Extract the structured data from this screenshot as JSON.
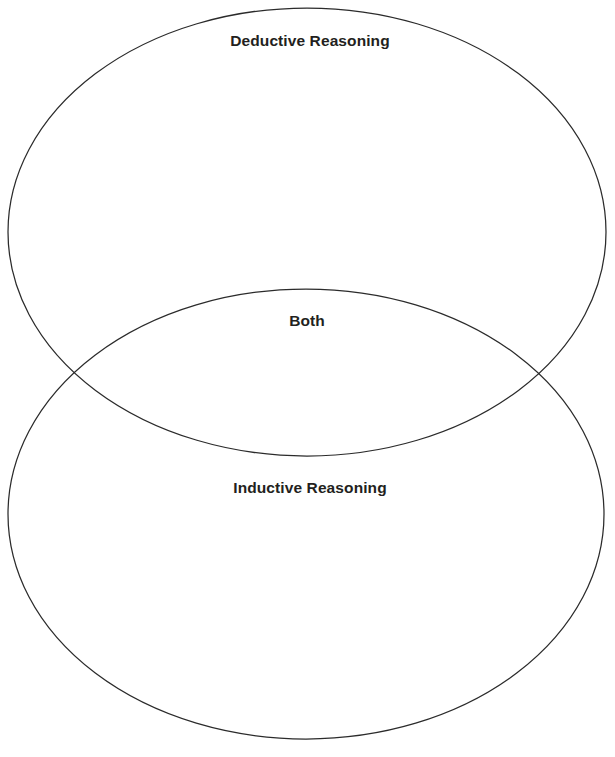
{
  "diagram": {
    "type": "venn",
    "title": "",
    "background_color": "#ffffff",
    "stroke_color": "#2b2b2b",
    "text_color": "#231f20",
    "sets": [
      {
        "id": "deductive",
        "label": "Deductive Reasoning",
        "position": "top",
        "shape": "ellipse",
        "cx": 307,
        "cy": 232,
        "rx": 299,
        "ry": 224,
        "items": []
      },
      {
        "id": "inductive",
        "label": "Inductive Reasoning",
        "position": "bottom",
        "shape": "ellipse",
        "cx": 306,
        "cy": 514,
        "rx": 298,
        "ry": 225,
        "items": []
      }
    ],
    "intersection": {
      "id": "both",
      "label": "Both",
      "position": "center",
      "items": []
    }
  }
}
